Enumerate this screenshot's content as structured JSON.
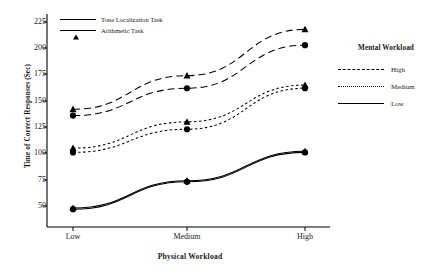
{
  "chart_data": {
    "type": "line",
    "title": "",
    "xlabel": "Physical Workload",
    "ylabel": "Time of Correct Responses (Sec)",
    "categories": [
      "Low",
      "Medium",
      "High"
    ],
    "xticklabels": [
      "Low",
      "Medium",
      "High"
    ],
    "yticklabels": [
      "225",
      "200",
      "175",
      "150",
      "125",
      "100",
      "75",
      "50"
    ],
    "ytickvalues": [
      225,
      200,
      175,
      150,
      125,
      100,
      75,
      50
    ],
    "ylim": [
      40,
      232
    ],
    "grid": false,
    "legend_position": "right-outside",
    "series": [
      {
        "name": "Arithmetic Task - High",
        "task": "Arithmetic Task",
        "mental_workload": "High",
        "marker": "triangle",
        "linestyle": "dashed",
        "values": [
          142,
          174,
          218
        ]
      },
      {
        "name": "Tone Localization Task - High",
        "task": "Tone Localization Task",
        "mental_workload": "High",
        "marker": "circle",
        "linestyle": "dashed",
        "values": [
          136,
          162,
          203
        ]
      },
      {
        "name": "Arithmetic Task - Medium",
        "task": "Arithmetic Task",
        "mental_workload": "Medium",
        "marker": "triangle",
        "linestyle": "dotted",
        "values": [
          105,
          130,
          165
        ]
      },
      {
        "name": "Tone Localization Task - Medium",
        "task": "Tone Localization Task",
        "mental_workload": "Medium",
        "marker": "circle",
        "linestyle": "dotted",
        "values": [
          101,
          123,
          162
        ]
      },
      {
        "name": "Arithmetic Task - Low",
        "task": "Arithmetic Task",
        "mental_workload": "Low",
        "marker": "triangle",
        "linestyle": "solid",
        "values": [
          48,
          74,
          102
        ]
      },
      {
        "name": "Tone Localization Task - Low",
        "task": "Tone Localization Task",
        "mental_workload": "Low",
        "marker": "circle",
        "linestyle": "solid",
        "values": [
          47,
          73,
          101
        ]
      }
    ]
  },
  "task_legend": {
    "items": [
      {
        "label": "Tone Localization Task",
        "marker": "circle"
      },
      {
        "label": "Arithmetic Task",
        "marker": "triangle"
      }
    ]
  },
  "mental_workload_legend": {
    "title": "Mental Workload",
    "items": [
      {
        "label": "High",
        "linestyle": "dashed"
      },
      {
        "label": "Medium",
        "linestyle": "dotted"
      },
      {
        "label": "Low",
        "linestyle": "solid"
      }
    ]
  },
  "colors": {
    "line": "#000000",
    "marker": "#000000",
    "axis": "#000000",
    "background": "#ffffff"
  }
}
